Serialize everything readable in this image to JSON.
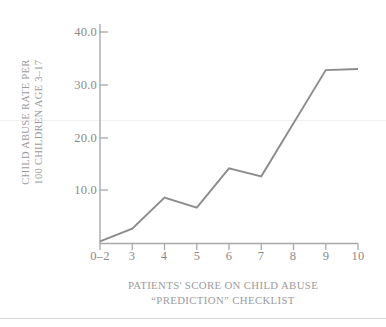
{
  "chart_data": {
    "type": "line",
    "title": "",
    "xlabel": "PATIENTS' SCORE ON CHILD ABUSE “PREDICTION” CHECKLIST",
    "xlabel_lines": [
      "PATIENTS' SCORE ON CHILD ABUSE",
      "“PREDICTION” CHECKLIST"
    ],
    "ylabel": "CHILD ABUSE RATE PER 100 CHILDREN AGE 3–17",
    "ylabel_lines": [
      "CHILD ABUSE RATE PER",
      "100 CHILDREN AGE 3–17"
    ],
    "categories": [
      "0–2",
      "3",
      "4",
      "5",
      "6",
      "7",
      "8",
      "9",
      "10"
    ],
    "values": [
      0.4,
      2.8,
      8.7,
      6.8,
      14.2,
      12.7,
      null,
      32.8,
      33.0
    ],
    "ytick_labels": [
      "10.0",
      "20.0",
      "30.0",
      "40.0"
    ],
    "ytick_values": [
      10,
      20,
      30,
      40
    ],
    "ylim": [
      0,
      42
    ],
    "grid": false,
    "legend": null,
    "series": [
      {
        "name": "child abuse rate",
        "points": [
          {
            "x": "0–2",
            "y": 0.4
          },
          {
            "x": "3",
            "y": 2.8
          },
          {
            "x": "4",
            "y": 8.7
          },
          {
            "x": "5",
            "y": 6.8
          },
          {
            "x": "6",
            "y": 14.2
          },
          {
            "x": "7",
            "y": 12.7
          },
          {
            "x": "9",
            "y": 32.8
          },
          {
            "x": "10",
            "y": 33.0
          }
        ]
      }
    ],
    "line_color": "#8c8c8e",
    "axis_color": "#a8a8aa",
    "text_color": "#8e8e90"
  }
}
